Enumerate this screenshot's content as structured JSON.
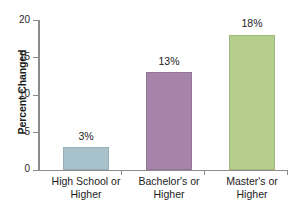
{
  "chart_data": {
    "type": "bar",
    "title": "",
    "xlabel": "",
    "ylabel": "Percent Changed",
    "categories": [
      "High School or Higher",
      "Bachelor's or Higher",
      "Master's or Higher"
    ],
    "category_lines": [
      [
        "High School or",
        "Higher"
      ],
      [
        "Bachelor's or",
        "Higher"
      ],
      [
        "Master's or",
        "Higher"
      ]
    ],
    "values": [
      3,
      13,
      18
    ],
    "data_labels": [
      "3%",
      "13%",
      "18%"
    ],
    "ylim": [
      0,
      20
    ],
    "yticks": [
      0,
      5,
      10,
      15,
      20
    ],
    "ytick_labels": [
      "0",
      "5",
      "10",
      "15",
      "20"
    ],
    "grid": false,
    "legend": "none",
    "bar_colors": [
      "#a8c2cc",
      "#a683a8",
      "#b5ce8e"
    ],
    "axis_color": "#8c8c8c",
    "text_color": "#1c1c1c",
    "background": "#ffffff"
  }
}
